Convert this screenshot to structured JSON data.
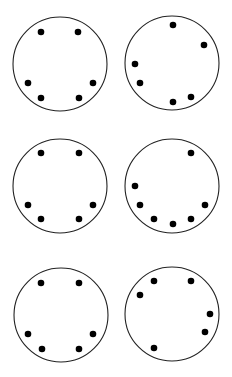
{
  "diagram": {
    "background": "#ffffff",
    "stroke_color": "#222222",
    "dot_color": "#000000",
    "dot_radius": 3.3,
    "circle_radius": 47,
    "circles": [
      {
        "id": "circle-1",
        "cx": 60,
        "cy": 64,
        "dots": [
          [
            41,
            32
          ],
          [
            78,
            32
          ],
          [
            28,
            83
          ],
          [
            93,
            83
          ],
          [
            41,
            98
          ],
          [
            79,
            98
          ]
        ]
      },
      {
        "id": "circle-2",
        "cx": 172,
        "cy": 63,
        "dots": [
          [
            173,
            25
          ],
          [
            204,
            45
          ],
          [
            135,
            64
          ],
          [
            140,
            83
          ],
          [
            173,
            102
          ],
          [
            191,
            97
          ]
        ]
      },
      {
        "id": "circle-3",
        "cx": 60,
        "cy": 186,
        "dots": [
          [
            41,
            153
          ],
          [
            79,
            153
          ],
          [
            28,
            205
          ],
          [
            93,
            205
          ],
          [
            41,
            219
          ],
          [
            79,
            219
          ]
        ]
      },
      {
        "id": "circle-4",
        "cx": 172,
        "cy": 186,
        "dots": [
          [
            191,
            153
          ],
          [
            135,
            186
          ],
          [
            140,
            205
          ],
          [
            154,
            219
          ],
          [
            173,
            224
          ],
          [
            191,
            219
          ],
          [
            205,
            205
          ]
        ]
      },
      {
        "id": "circle-5",
        "cx": 61,
        "cy": 315,
        "dots": [
          [
            41,
            283
          ],
          [
            79,
            283
          ],
          [
            28,
            334
          ],
          [
            93,
            334
          ],
          [
            42,
            349
          ],
          [
            79,
            349
          ]
        ]
      },
      {
        "id": "circle-6",
        "cx": 172,
        "cy": 314,
        "dots": [
          [
            154,
            281
          ],
          [
            191,
            281
          ],
          [
            140,
            295
          ],
          [
            210,
            314
          ],
          [
            205,
            332
          ],
          [
            154,
            348
          ]
        ]
      }
    ]
  }
}
